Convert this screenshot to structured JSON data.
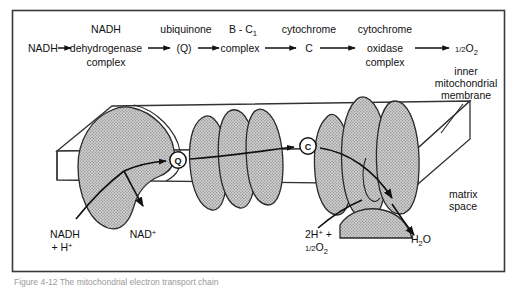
{
  "figure": {
    "border_color": "#3a3a3a",
    "background": "#ffffff",
    "ink_color": "#111111",
    "complex_fill": "#c9c9c9",
    "membrane_fill": "#ffffff",
    "caption_text": "Figure 4-12 The mitochondrial electron transport chain"
  },
  "chain": {
    "nodes": [
      {
        "id": "nadh",
        "lines": [
          "NADH"
        ]
      },
      {
        "id": "nadh-dehydrogenase",
        "lines": [
          "NADH",
          "dehydrogenase",
          "complex"
        ]
      },
      {
        "id": "ubiquinone",
        "lines": [
          "ubiquinone",
          "(Q)"
        ]
      },
      {
        "id": "bc1",
        "lines": [
          "B - C",
          "complex"
        ],
        "sub": "1"
      },
      {
        "id": "cytochrome-c",
        "lines": [
          "cytochrome",
          "C"
        ]
      },
      {
        "id": "cytochrome-oxidase",
        "lines": [
          "cytochrome",
          "oxidase",
          "complex"
        ]
      },
      {
        "id": "half-o2",
        "lines": [
          "O"
        ],
        "frac": "1/2",
        "sub": "2"
      }
    ]
  },
  "labels": {
    "inner_membrane": [
      "inner",
      "mitochondrial",
      "membrane"
    ],
    "matrix_space": [
      "matrix",
      "space"
    ],
    "nadh_in": {
      "line1": "NADH",
      "line2": "+ H",
      "sup": "+"
    },
    "nad_out": {
      "text": "NAD",
      "sup": "+"
    },
    "protons_oxygen": {
      "line1": "2H",
      "sup1": "+",
      "plus": " +",
      "line2": "O",
      "frac": "1/2",
      "sub2": "2"
    },
    "water": {
      "text": "H",
      "sub": "2",
      "tail": "O"
    }
  },
  "membrane_markers": [
    {
      "id": "q-marker",
      "letter": "Q",
      "cx": 178,
      "cy": 160
    },
    {
      "id": "c-marker",
      "letter": "C",
      "cx": 308,
      "cy": 146
    }
  ]
}
